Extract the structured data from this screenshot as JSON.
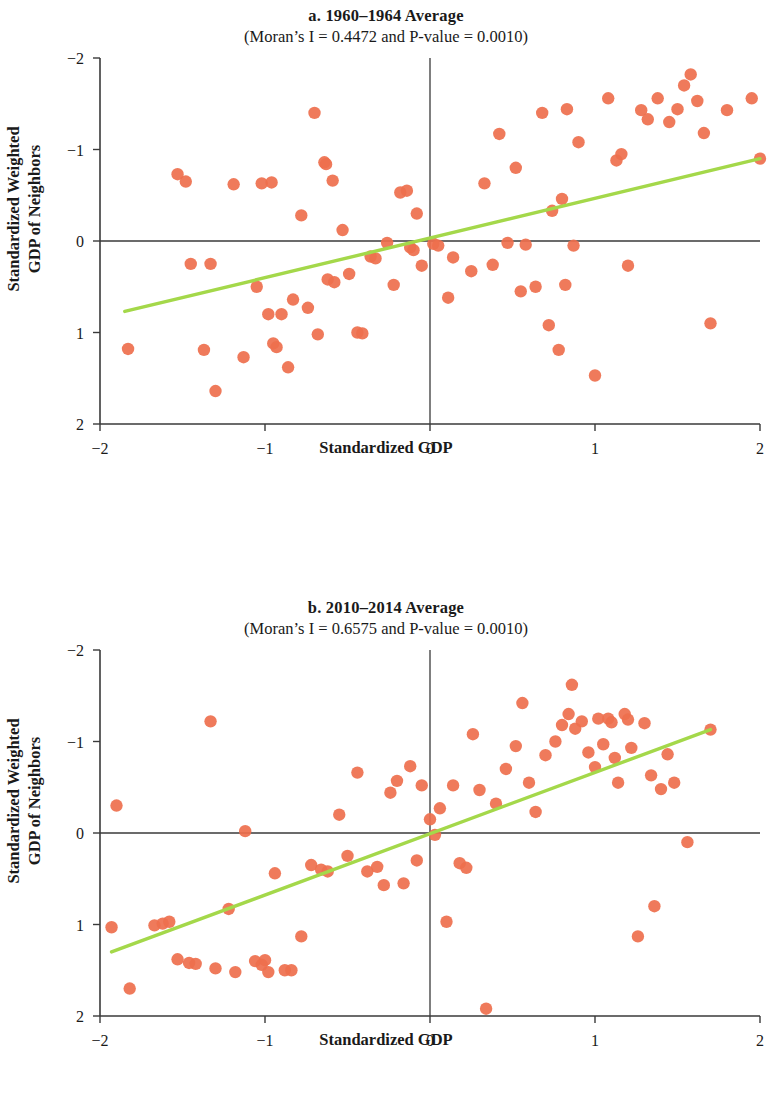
{
  "figure": {
    "point_color": "#ee6f4d",
    "line_color": "#a4d84a",
    "axis_color": "#3a3a3a"
  },
  "panels": [
    {
      "id": "a",
      "title": "a. 1960–1964 Average",
      "subtitle": "(Moran’s I = 0.4472 and P-value = 0.0010)",
      "xlabel": "Standardized GDP",
      "ylabel_line1": "Standardized Weighted",
      "ylabel_line2": "GDP of Neighbors",
      "xticks": [
        "−2",
        "−1",
        "0",
        "1",
        "2"
      ],
      "yticks": [
        "2",
        "1",
        "0",
        "−1",
        "−2"
      ]
    },
    {
      "id": "b",
      "title": "b. 2010–2014 Average",
      "subtitle": "(Moran’s I = 0.6575 and P-value = 0.0010)",
      "xlabel": "Standardized GDP",
      "ylabel_line1": "Standardized Weighted",
      "ylabel_line2": "GDP of Neighbors",
      "xticks": [
        "−2",
        "−1",
        "0",
        "1",
        "2"
      ],
      "yticks": [
        "2",
        "1",
        "0",
        "−1",
        "−2"
      ]
    }
  ],
  "chart_data": [
    {
      "type": "scatter",
      "panel": "a",
      "title": "a. 1960–1964 Average",
      "subtitle": "(Moran’s I = 0.4472 and P-value = 0.0010)",
      "xlabel": "Standardized GDP",
      "ylabel": "Standardized Weighted GDP of Neighbors",
      "xlim": [
        -2,
        2
      ],
      "ylim": [
        -2,
        2
      ],
      "xticks": [
        -2,
        -1,
        0,
        1,
        2
      ],
      "yticks": [
        -2,
        -1,
        0,
        1,
        2
      ],
      "grid": false,
      "legend": null,
      "statistics": {
        "morans_i": 0.4472,
        "p_value": 0.001
      },
      "reference_lines": {
        "vertical_x": 0,
        "horizontal_y": 0
      },
      "trend_line": {
        "color": "#a4d84a",
        "x0": -1.85,
        "y0": -0.77,
        "x1": 2.0,
        "y1": 0.9
      },
      "points": [
        [
          -1.83,
          -1.18
        ],
        [
          -1.53,
          0.73
        ],
        [
          -1.48,
          0.65
        ],
        [
          -1.45,
          -0.25
        ],
        [
          -1.37,
          -1.19
        ],
        [
          -1.33,
          -0.25
        ],
        [
          -1.3,
          -1.64
        ],
        [
          -1.19,
          0.62
        ],
        [
          -1.13,
          -1.27
        ],
        [
          -1.05,
          -0.5
        ],
        [
          -1.02,
          0.63
        ],
        [
          -0.98,
          -0.8
        ],
        [
          -0.96,
          0.64
        ],
        [
          -0.95,
          -1.12
        ],
        [
          -0.93,
          -1.16
        ],
        [
          -0.9,
          -0.8
        ],
        [
          -0.86,
          -1.38
        ],
        [
          -0.83,
          -0.64
        ],
        [
          -0.78,
          0.28
        ],
        [
          -0.74,
          -0.73
        ],
        [
          -0.7,
          1.4
        ],
        [
          -0.68,
          -1.02
        ],
        [
          -0.64,
          0.86
        ],
        [
          -0.63,
          0.84
        ],
        [
          -0.62,
          -0.42
        ],
        [
          -0.59,
          0.66
        ],
        [
          -0.58,
          -0.45
        ],
        [
          -0.53,
          0.12
        ],
        [
          -0.49,
          -0.36
        ],
        [
          -0.44,
          -1.0
        ],
        [
          -0.41,
          -1.01
        ],
        [
          -0.36,
          -0.17
        ],
        [
          -0.33,
          -0.19
        ],
        [
          -0.26,
          -0.02
        ],
        [
          -0.22,
          -0.48
        ],
        [
          -0.18,
          0.53
        ],
        [
          -0.14,
          0.55
        ],
        [
          -0.12,
          -0.07
        ],
        [
          -0.1,
          -0.1
        ],
        [
          -0.08,
          0.3
        ],
        [
          -0.05,
          -0.27
        ],
        [
          0.02,
          -0.03
        ],
        [
          0.05,
          -0.05
        ],
        [
          0.11,
          -0.62
        ],
        [
          0.14,
          -0.18
        ],
        [
          0.25,
          -0.33
        ],
        [
          0.33,
          0.63
        ],
        [
          0.38,
          -0.26
        ],
        [
          0.42,
          1.17
        ],
        [
          0.47,
          -0.02
        ],
        [
          0.52,
          0.8
        ],
        [
          0.55,
          -0.55
        ],
        [
          0.58,
          -0.04
        ],
        [
          0.64,
          -0.5
        ],
        [
          0.68,
          1.4
        ],
        [
          0.72,
          -0.92
        ],
        [
          0.74,
          0.33
        ],
        [
          0.78,
          -1.19
        ],
        [
          0.8,
          0.46
        ],
        [
          0.82,
          -0.48
        ],
        [
          0.83,
          1.44
        ],
        [
          0.87,
          -0.05
        ],
        [
          0.9,
          1.08
        ],
        [
          1.0,
          -1.47
        ],
        [
          1.08,
          1.56
        ],
        [
          1.13,
          0.88
        ],
        [
          1.16,
          0.95
        ],
        [
          1.2,
          -0.27
        ],
        [
          1.28,
          1.43
        ],
        [
          1.32,
          1.33
        ],
        [
          1.38,
          1.56
        ],
        [
          1.45,
          1.3
        ],
        [
          1.5,
          1.44
        ],
        [
          1.54,
          1.7
        ],
        [
          1.58,
          1.82
        ],
        [
          1.62,
          1.53
        ],
        [
          1.66,
          1.18
        ],
        [
          1.7,
          -0.9
        ],
        [
          1.8,
          1.43
        ],
        [
          1.95,
          1.56
        ],
        [
          2.0,
          0.9
        ]
      ]
    },
    {
      "type": "scatter",
      "panel": "b",
      "title": "b. 2010–2014 Average",
      "subtitle": "(Moran’s I = 0.6575 and P-value = 0.0010)",
      "xlabel": "Standardized GDP",
      "ylabel": "Standardized Weighted GDP of Neighbors",
      "xlim": [
        -2,
        2
      ],
      "ylim": [
        -2,
        2
      ],
      "xticks": [
        -2,
        -1,
        0,
        1,
        2
      ],
      "yticks": [
        -2,
        -1,
        0,
        1,
        2
      ],
      "grid": false,
      "legend": null,
      "statistics": {
        "morans_i": 0.6575,
        "p_value": 0.001
      },
      "reference_lines": {
        "vertical_x": 0,
        "horizontal_y": 0
      },
      "trend_line": {
        "color": "#a4d84a",
        "x0": -1.93,
        "y0": -1.3,
        "x1": 1.7,
        "y1": 1.13
      },
      "points": [
        [
          -1.93,
          -1.03
        ],
        [
          -1.9,
          0.3
        ],
        [
          -1.82,
          -1.7
        ],
        [
          -1.67,
          -1.01
        ],
        [
          -1.62,
          -0.99
        ],
        [
          -1.58,
          -0.97
        ],
        [
          -1.53,
          -1.38
        ],
        [
          -1.46,
          -1.42
        ],
        [
          -1.42,
          -1.43
        ],
        [
          -1.33,
          1.22
        ],
        [
          -1.3,
          -1.48
        ],
        [
          -1.22,
          -0.83
        ],
        [
          -1.18,
          -1.52
        ],
        [
          -1.12,
          0.02
        ],
        [
          -1.06,
          -1.4
        ],
        [
          -1.02,
          -1.44
        ],
        [
          -0.98,
          -1.52
        ],
        [
          -0.94,
          -0.44
        ],
        [
          -1.0,
          -1.39
        ],
        [
          -0.88,
          -1.5
        ],
        [
          -0.84,
          -1.5
        ],
        [
          -0.78,
          -1.13
        ],
        [
          -0.72,
          -0.35
        ],
        [
          -0.66,
          -0.4
        ],
        [
          -0.62,
          -0.42
        ],
        [
          -0.55,
          0.2
        ],
        [
          -0.5,
          -0.25
        ],
        [
          -0.44,
          0.66
        ],
        [
          -0.38,
          -0.42
        ],
        [
          -0.32,
          -0.37
        ],
        [
          -0.28,
          -0.57
        ],
        [
          -0.24,
          0.44
        ],
        [
          -0.2,
          0.57
        ],
        [
          -0.16,
          -0.55
        ],
        [
          -0.12,
          0.73
        ],
        [
          -0.08,
          -0.3
        ],
        [
          -0.05,
          0.52
        ],
        [
          0.0,
          0.15
        ],
        [
          0.03,
          -0.02
        ],
        [
          0.06,
          0.27
        ],
        [
          0.1,
          -0.97
        ],
        [
          0.14,
          0.52
        ],
        [
          0.18,
          -0.33
        ],
        [
          0.22,
          -0.38
        ],
        [
          0.26,
          1.08
        ],
        [
          0.3,
          0.47
        ],
        [
          0.34,
          -1.92
        ],
        [
          0.4,
          0.32
        ],
        [
          0.46,
          0.7
        ],
        [
          0.52,
          0.95
        ],
        [
          0.56,
          1.42
        ],
        [
          0.6,
          0.55
        ],
        [
          0.64,
          0.23
        ],
        [
          0.7,
          0.85
        ],
        [
          0.76,
          1.0
        ],
        [
          0.8,
          1.18
        ],
        [
          0.84,
          1.3
        ],
        [
          0.86,
          1.62
        ],
        [
          0.88,
          1.14
        ],
        [
          0.92,
          1.22
        ],
        [
          0.96,
          0.88
        ],
        [
          1.0,
          0.72
        ],
        [
          1.02,
          1.25
        ],
        [
          1.05,
          0.97
        ],
        [
          1.08,
          1.25
        ],
        [
          1.1,
          1.21
        ],
        [
          1.12,
          0.82
        ],
        [
          1.14,
          0.55
        ],
        [
          1.18,
          1.3
        ],
        [
          1.2,
          1.24
        ],
        [
          1.22,
          0.93
        ],
        [
          1.26,
          -1.13
        ],
        [
          1.3,
          1.2
        ],
        [
          1.34,
          0.63
        ],
        [
          1.36,
          -0.8
        ],
        [
          1.4,
          0.48
        ],
        [
          1.44,
          0.86
        ],
        [
          1.48,
          0.55
        ],
        [
          1.56,
          -0.1
        ],
        [
          1.7,
          1.13
        ]
      ]
    }
  ]
}
